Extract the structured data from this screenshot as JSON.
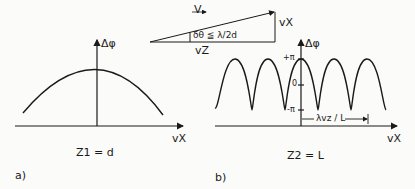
{
  "vector_triangle": {
    "hypotenuse_label": "V",
    "vertical_label": "vX",
    "base_label": "vZ",
    "angle_label": "δθ ≦ λ/2d"
  },
  "panel_a": {
    "y_axis_label": "Δφ",
    "x_axis_label": "vX",
    "condition": "Z1 = d",
    "panel_tag": "a)",
    "curve": "parabola-like single broad maximum centered at vX = 0"
  },
  "panel_b": {
    "y_axis_label": "Δφ",
    "x_axis_label": "vX",
    "y_ticks": [
      "+π",
      "0",
      "-π"
    ],
    "period_label": "λvz / L",
    "condition": "Z2 = L",
    "panel_tag": "b)",
    "curve": "sinusoid oscillating between -π and +π, maximum at vX = 0"
  },
  "colors": {
    "ink": "#1a1a1a",
    "paper": "#fbfbf9"
  }
}
